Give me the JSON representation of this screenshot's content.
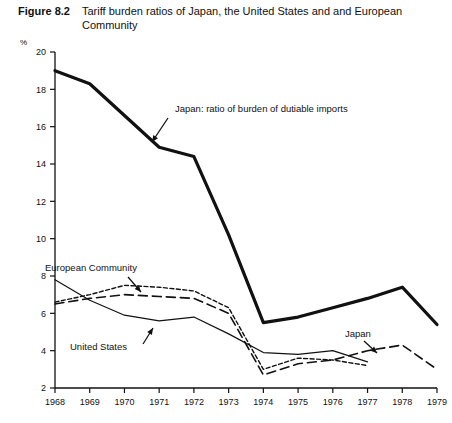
{
  "figure": {
    "label": "Figure 8.2",
    "title": "Tariff burden ratios of Japan, the United States and and European Community"
  },
  "axis": {
    "y_unit": "%"
  },
  "chart_data": {
    "type": "line",
    "title": "Tariff burden ratios of Japan, the United States and and European Community",
    "xlabel": "",
    "ylabel": "%",
    "xlim": [
      1968,
      1979
    ],
    "ylim": [
      2,
      20
    ],
    "ytick_step": 2,
    "grid": false,
    "legend": "inline-annotations",
    "x": [
      1968,
      1969,
      1970,
      1971,
      1972,
      1973,
      1974,
      1975,
      1976,
      1977,
      1978,
      1979
    ],
    "yticks": [
      2,
      4,
      6,
      8,
      10,
      12,
      14,
      16,
      18,
      20
    ],
    "xticks": [
      "1968",
      "1969",
      "1970",
      "1971",
      "1972",
      "1973",
      "1974",
      "1975",
      "1976",
      "1977",
      "1978",
      "1979"
    ],
    "series": [
      {
        "name": "Japan: ratio of burden of dutiable imports",
        "style": "thick-solid",
        "x": [
          1968,
          1969,
          1970,
          1971,
          1972,
          1973,
          1974,
          1975,
          1976,
          1977,
          1978,
          1979
        ],
        "values": [
          19.0,
          18.3,
          16.6,
          14.9,
          14.4,
          10.2,
          5.5,
          5.8,
          6.3,
          6.8,
          7.4,
          5.4
        ]
      },
      {
        "name": "European Community",
        "style": "dotted",
        "x": [
          1968,
          1969,
          1970,
          1971,
          1972,
          1973,
          1974,
          1975,
          1976,
          1977
        ],
        "values": [
          6.6,
          7.0,
          7.5,
          7.4,
          7.2,
          6.3,
          3.0,
          3.6,
          3.5,
          3.2
        ]
      },
      {
        "name": "United States",
        "style": "thin-solid",
        "x": [
          1968,
          1969,
          1970,
          1971,
          1972,
          1973,
          1974,
          1975,
          1976,
          1977
        ],
        "values": [
          7.8,
          6.7,
          5.9,
          5.6,
          5.8,
          4.9,
          3.9,
          3.8,
          4.0,
          3.4
        ]
      },
      {
        "name": "Japan",
        "style": "dashed",
        "x": [
          1968,
          1969,
          1970,
          1971,
          1972,
          1973,
          1974,
          1975,
          1976,
          1977,
          1978,
          1979
        ],
        "values": [
          6.5,
          6.8,
          7.0,
          6.9,
          6.8,
          6.0,
          2.7,
          3.3,
          3.5,
          4.0,
          4.3,
          3.0
        ]
      }
    ],
    "annotations": [
      {
        "text": "Japan: ratio of burden of dutiable imports",
        "target_series": "Japan: ratio of burden of dutiable imports"
      },
      {
        "text": "European Community",
        "target_series": "European Community"
      },
      {
        "text": "United States",
        "target_series": "United States"
      },
      {
        "text": "Japan",
        "target_series": "Japan"
      }
    ]
  },
  "colors": {
    "ink": "#111111",
    "background": "#ffffff"
  }
}
